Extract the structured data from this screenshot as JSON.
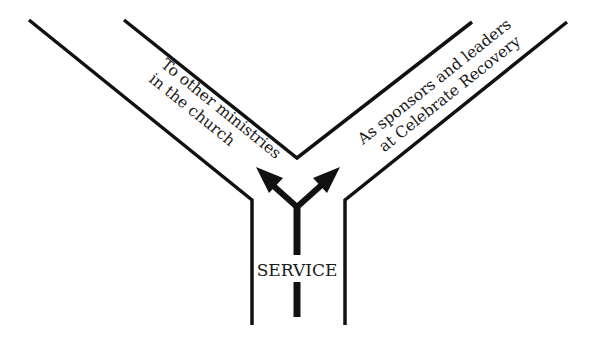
{
  "diagram": {
    "type": "Y-shaped path diagram",
    "stem_label": "SERVICE",
    "branches": [
      {
        "side": "left",
        "lines": [
          "To other ministries",
          "in the church"
        ]
      },
      {
        "side": "right",
        "lines": [
          "As sponsors and leaders",
          "at Celebrate Recovery"
        ]
      }
    ],
    "colors": {
      "line": "#111111",
      "background": "#ffffff",
      "text": "#1a1a1a"
    }
  }
}
